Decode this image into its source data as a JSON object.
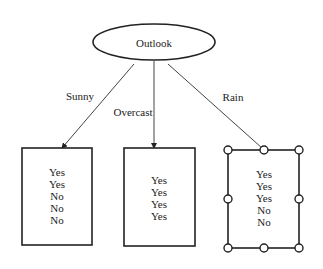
{
  "root": {
    "label": "Outlook"
  },
  "branches": [
    {
      "label": "Sunny",
      "values": [
        "Yes",
        "Yes",
        "No",
        "No",
        "No"
      ]
    },
    {
      "label": "Overcast",
      "values": [
        "Yes",
        "Yes",
        "Yes",
        "Yes"
      ]
    },
    {
      "label": "Rain",
      "values": [
        "Yes",
        "Yes",
        "Yes",
        "No",
        "No"
      ],
      "selected": true
    }
  ]
}
